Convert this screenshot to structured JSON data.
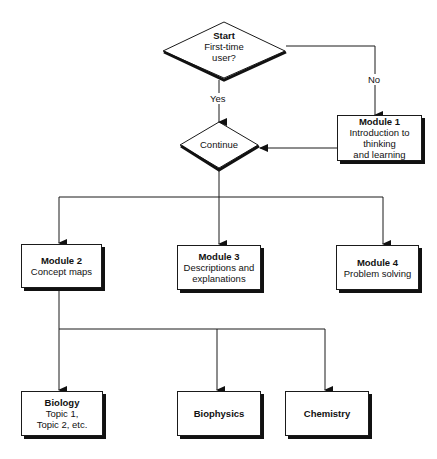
{
  "diagram": {
    "type": "flowchart",
    "colors": {
      "line": "#1a1a1a",
      "shadow": "#111111",
      "background": "#ffffff"
    },
    "decisions": [
      {
        "id": "start",
        "title": "Start",
        "lines": [
          "First-time",
          "user?"
        ]
      },
      {
        "id": "continue",
        "title": "",
        "lines": [
          "Continue"
        ]
      }
    ],
    "edge_labels": {
      "yes": "Yes",
      "no": "No"
    },
    "modules": [
      {
        "id": "module1",
        "title": "Module 1",
        "lines": [
          "Introduction to",
          "thinking",
          "and learning"
        ]
      },
      {
        "id": "module2",
        "title": "Module 2",
        "lines": [
          "Concept maps"
        ]
      },
      {
        "id": "module3",
        "title": "Module 3",
        "lines": [
          "Descriptions and",
          "explanations"
        ]
      },
      {
        "id": "module4",
        "title": "Module 4",
        "lines": [
          "Problem solving"
        ]
      }
    ],
    "topics": [
      {
        "id": "biology",
        "title": "Biology",
        "lines": [
          "Topic 1,",
          "Topic 2, etc."
        ]
      },
      {
        "id": "biophysics",
        "title": "Biophysics",
        "lines": []
      },
      {
        "id": "chemistry",
        "title": "Chemistry",
        "lines": []
      }
    ],
    "edges": [
      {
        "from": "start",
        "to": "continue",
        "label": "Yes"
      },
      {
        "from": "start",
        "to": "module1",
        "label": "No"
      },
      {
        "from": "module1",
        "to": "continue",
        "label": ""
      },
      {
        "from": "continue",
        "to": "module2",
        "label": ""
      },
      {
        "from": "continue",
        "to": "module3",
        "label": ""
      },
      {
        "from": "continue",
        "to": "module4",
        "label": ""
      },
      {
        "from": "module2",
        "to": "biology",
        "label": ""
      },
      {
        "from": "module2",
        "to": "biophysics",
        "label": ""
      },
      {
        "from": "module2",
        "to": "chemistry",
        "label": ""
      }
    ]
  }
}
